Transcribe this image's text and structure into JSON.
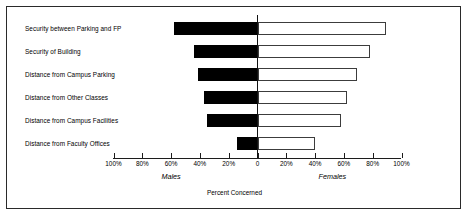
{
  "chart_data": {
    "type": "bar",
    "subtype": "diverging-horizontal-bar",
    "title": "",
    "xlabel": "Percent Concerned",
    "ylabel": "",
    "xlim": [
      -100,
      100
    ],
    "grid": false,
    "legend_position": "below-axis",
    "categories": [
      "Security between Parking and FP",
      "Security of Building",
      "Distance from Campus Parking",
      "Distance from Other Classes",
      "Distance from Campus Facilities",
      "Distance from Faculty Offices"
    ],
    "series": [
      {
        "name": "Males",
        "direction": "left",
        "color": "#000000",
        "values": [
          58,
          44,
          41,
          37,
          35,
          14
        ]
      },
      {
        "name": "Females",
        "direction": "right",
        "color": "#ffffff",
        "values": [
          89,
          78,
          69,
          62,
          58,
          40
        ]
      }
    ],
    "x_ticks": [
      {
        "value": -100,
        "label": "100%"
      },
      {
        "value": -80,
        "label": "80%"
      },
      {
        "value": -60,
        "label": "60%"
      },
      {
        "value": -40,
        "label": "40%"
      },
      {
        "value": -20,
        "label": "20%"
      },
      {
        "value": 0,
        "label": "0"
      },
      {
        "value": 20,
        "label": "20%"
      },
      {
        "value": 40,
        "label": "40%"
      },
      {
        "value": 60,
        "label": "60%"
      },
      {
        "value": 80,
        "label": "80%"
      },
      {
        "value": 100,
        "label": "100%"
      }
    ],
    "group_labels": [
      {
        "text": "Males",
        "value": -60
      },
      {
        "text": "Females",
        "value": 52
      }
    ]
  }
}
